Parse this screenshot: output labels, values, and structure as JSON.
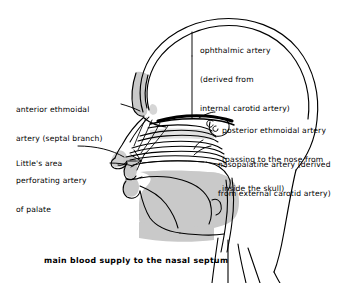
{
  "figure": {
    "caption": "main blood supply to the nasal septum",
    "background_color": "#ffffff",
    "ink_color": "#000000",
    "shade_color": "#c9c9c9"
  },
  "labels": {
    "ophthalmic": {
      "line1": "ophthalmic artery",
      "line2": "(derived from",
      "line3": "internal carotid artery)"
    },
    "anterior_ethmoidal": {
      "line1": "anterior ethmoidal",
      "line2": "artery (septal branch)"
    },
    "posterior_ethmoidal": {
      "line1": "posterior ethmoidal artery",
      "line2": "(passing to the nose from",
      "line3": "inside the skull)"
    },
    "littles_area": {
      "line1": "Little's area"
    },
    "perforating_palate": {
      "line1": "perforating artery",
      "line2": "of palate"
    },
    "nasopalatine": {
      "line1": "nasopalatine artery (derived",
      "line2": "from external carotid artery)"
    }
  },
  "anatomy_parts": [
    "cranial vault",
    "frontal sinus region",
    "nasal bone",
    "superior concha",
    "middle concha",
    "inferior concha",
    "nasal septum vessels",
    "hard palate",
    "soft palate",
    "tongue",
    "oral cavity",
    "oropharynx",
    "mandible",
    "neck"
  ]
}
